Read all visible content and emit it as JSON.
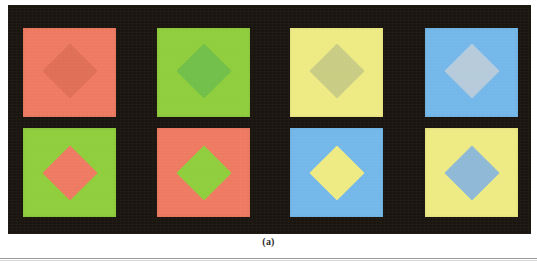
{
  "figure": {
    "caption": "(a)",
    "panel_background": "#1b1510",
    "page_background": "#ffffff",
    "rule_color": "#9a9a9a",
    "columns": 4,
    "rows": 2
  },
  "geometry": {
    "panel": {
      "left": 8,
      "top": 5,
      "width": 523,
      "height": 229
    },
    "square_size": {
      "width": 93,
      "height": 89
    },
    "column_left": [
      15,
      149,
      282,
      417
    ],
    "row_top": [
      23,
      123
    ],
    "diamond_size": 39
  },
  "swatches": [
    {
      "id": "r1c1",
      "row": 1,
      "column": 1,
      "background_name": "salmon",
      "background_color": "#ef7a62",
      "diamond_name": "darker-salmon",
      "diamond_color": "#e06f58",
      "contrast": "low"
    },
    {
      "id": "r1c2",
      "row": 1,
      "column": 2,
      "background_name": "yellow-green",
      "background_color": "#8fce3c",
      "diamond_name": "darker-yellow-green",
      "diamond_color": "#72c04a",
      "contrast": "low"
    },
    {
      "id": "r1c3",
      "row": 1,
      "column": 3,
      "background_name": "pale-yellow",
      "background_color": "#eeea84",
      "diamond_name": "olive-gray",
      "diamond_color": "#c9cd84",
      "contrast": "low"
    },
    {
      "id": "r1c4",
      "row": 1,
      "column": 4,
      "background_name": "sky-blue",
      "background_color": "#74b8ea",
      "diamond_name": "pale-gray-blue",
      "diamond_color": "#b6cbdb",
      "contrast": "low"
    },
    {
      "id": "r2c1",
      "row": 2,
      "column": 1,
      "background_name": "yellow-green",
      "background_color": "#8fce3c",
      "diamond_name": "salmon",
      "diamond_color": "#ef7a62",
      "contrast": "high"
    },
    {
      "id": "r2c2",
      "row": 2,
      "column": 2,
      "background_name": "salmon",
      "background_color": "#ef7a62",
      "diamond_name": "yellow-green",
      "diamond_color": "#8fce3c",
      "contrast": "high"
    },
    {
      "id": "r2c3",
      "row": 2,
      "column": 3,
      "background_name": "sky-blue",
      "background_color": "#74b8ea",
      "diamond_name": "pale-yellow",
      "diamond_color": "#eeea84",
      "contrast": "high"
    },
    {
      "id": "r2c4",
      "row": 2,
      "column": 4,
      "background_name": "pale-yellow",
      "background_color": "#eeea84",
      "diamond_name": "sky-blue",
      "diamond_color": "#8fb9d6",
      "contrast": "high"
    }
  ]
}
